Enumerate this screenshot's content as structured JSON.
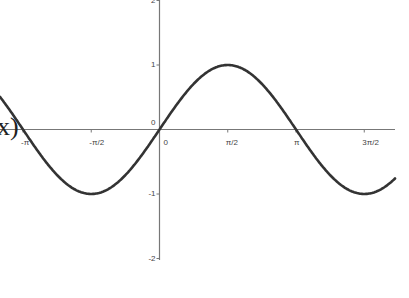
{
  "chart_data": {
    "type": "line",
    "title": "",
    "function_label": "x)",
    "xlabel": "",
    "ylabel": "",
    "x_ticks": [
      {
        "label": "-π",
        "value": -3.14159
      },
      {
        "label": "-π/2",
        "value": -1.5708
      },
      {
        "label": "0",
        "value": 0
      },
      {
        "label": "π/2",
        "value": 1.5708
      },
      {
        "label": "π",
        "value": 3.14159
      },
      {
        "label": "3π/2",
        "value": 4.71239
      }
    ],
    "y_ticks": [
      {
        "label": "2",
        "value": 2
      },
      {
        "label": "1",
        "value": 1
      },
      {
        "label": "0",
        "value": 0
      },
      {
        "label": "-1",
        "value": -1
      },
      {
        "label": "-2",
        "value": -2
      }
    ],
    "xlim": [
      -3.66,
      5.76
    ],
    "ylim": [
      -2.05,
      2.0
    ],
    "grid": false,
    "series": [
      {
        "name": "sin(x)",
        "expression": "sin(x)",
        "x": [
          -3.66,
          -3.14159,
          -2.35619,
          -1.5708,
          -0.7854,
          0,
          0.7854,
          1.5708,
          2.35619,
          3.14159,
          3.92699,
          4.71239,
          5.49779,
          5.76
        ],
        "values": [
          0.5,
          0,
          -0.707,
          -1,
          -0.707,
          0,
          0.707,
          1,
          0.707,
          0,
          -0.707,
          -1,
          -0.707,
          -0.5
        ]
      }
    ],
    "colors": {
      "curve": "#333333",
      "axis": "#777777",
      "background": "#ffffff"
    }
  }
}
